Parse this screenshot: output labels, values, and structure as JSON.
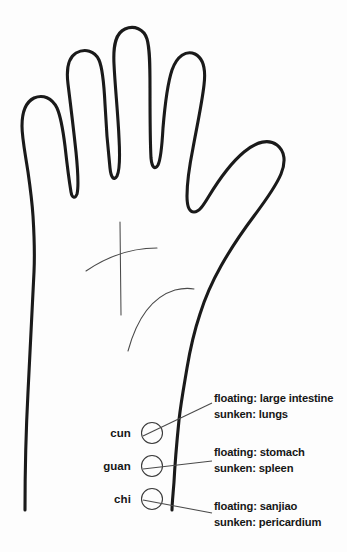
{
  "figure": {
    "background_color": "#fdfdfd",
    "ink_color": "#1a1a1a",
    "line_color": "#4a4a4a"
  },
  "pulse_positions": [
    {
      "id": "cun",
      "label": "cun",
      "floating": "floating: large intestine",
      "sunken": "sunken: lungs"
    },
    {
      "id": "guan",
      "label": "guan",
      "floating": "floating: stomach",
      "sunken": "sunken: spleen"
    },
    {
      "id": "chi",
      "label": "chi",
      "floating": "floating: sanjiao",
      "sunken": "sunken: pericardium"
    }
  ]
}
